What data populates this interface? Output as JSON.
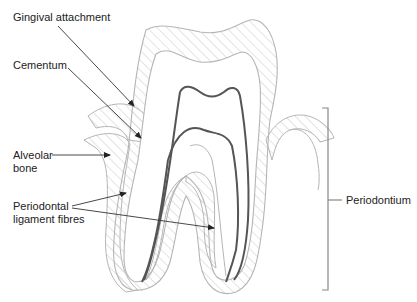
{
  "diagram": {
    "labels": {
      "gingival_attachment": "Gingival attachment",
      "cementum": "Cementum",
      "alveolar_bone_line1": "Alveolar",
      "alveolar_bone_line2": "bone",
      "pdl_line1": "Periodontal",
      "pdl_line2": "ligament fibres",
      "periodontium": "Periodontium"
    },
    "colors": {
      "outline_light": "#b5b5b5",
      "hatch": "#d0d0d0",
      "pulp_outline": "#555555",
      "leader_line": "#333333",
      "text": "#222222"
    }
  }
}
